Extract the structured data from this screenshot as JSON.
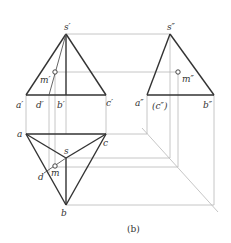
{
  "figure": {
    "caption": "(b)"
  },
  "labels": {
    "front": {
      "s": "s′",
      "a": "a′",
      "b": "b′",
      "c": "c′",
      "d": "d′",
      "m": "m′"
    },
    "side": {
      "s": "s″",
      "a": "a″",
      "b": "b″",
      "c": "(c″)",
      "m": "m″"
    },
    "top": {
      "s": "s",
      "a": "a",
      "b": "b",
      "c": "c",
      "d": "d",
      "m": "m"
    }
  },
  "points": {
    "front": {
      "s": [
        66,
        34
      ],
      "a": [
        26,
        95
      ],
      "b": [
        66,
        95
      ],
      "c": [
        106,
        95
      ],
      "d": [
        49,
        95
      ],
      "m": [
        55,
        72
      ]
    },
    "side": {
      "s": [
        170,
        34
      ],
      "a": [
        147,
        95
      ],
      "b": [
        214,
        95
      ],
      "c": [
        170,
        95
      ],
      "m": [
        178,
        72
      ]
    },
    "top": {
      "s": [
        66,
        158
      ],
      "a": [
        26,
        134
      ],
      "b": [
        66,
        205
      ],
      "c": [
        106,
        134
      ],
      "d": [
        44,
        173
      ],
      "m": [
        55,
        167
      ]
    },
    "miter": {
      "start": [
        142,
        128
      ],
      "end": [
        216,
        210
      ]
    }
  },
  "colors": {
    "line": "#333333",
    "construction": "#b8b8b8"
  }
}
